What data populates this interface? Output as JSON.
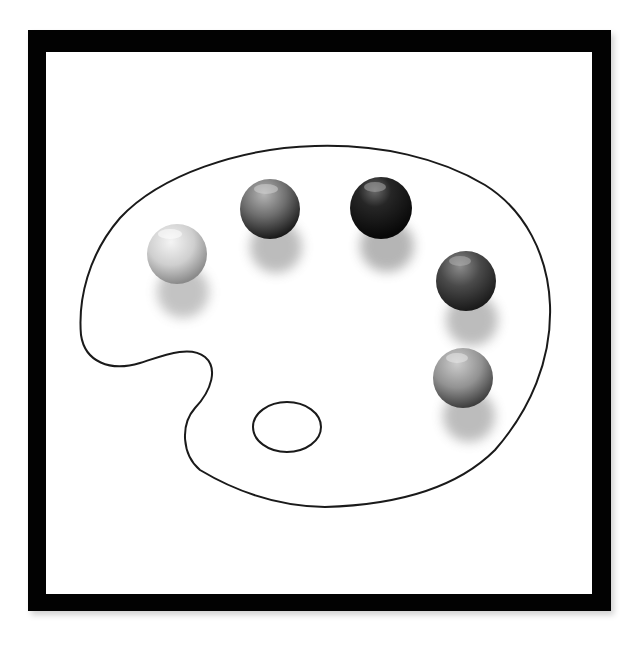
{
  "image": {
    "description": "Grayscale illustration of an artist's paint palette outline with five round candies placed as paint dabs, inside a thick black square frame",
    "colors": {
      "frame": "#020202",
      "background": "#ffffff",
      "outline": "#1a1a1a"
    }
  },
  "frame": {
    "outer": {
      "x": 28,
      "y": 30,
      "width": 583,
      "height": 581
    },
    "inner": {
      "x": 46,
      "y": 52,
      "width": 546,
      "height": 542
    }
  },
  "palette": {
    "thumb_hole": {
      "cx": 287,
      "cy": 427,
      "rx": 34,
      "ry": 25
    }
  },
  "candies": [
    {
      "name": "candy-light",
      "cx": 177,
      "cy": 254,
      "r": 30,
      "light": "#eeeeee",
      "mid": "#c8c8c8",
      "dark": "#8a8a8a"
    },
    {
      "name": "candy-medium",
      "cx": 270,
      "cy": 209,
      "r": 30,
      "light": "#b0b0b0",
      "mid": "#6e6e6e",
      "dark": "#1e1e1e"
    },
    {
      "name": "candy-dark",
      "cx": 381,
      "cy": 208,
      "r": 31,
      "light": "#7a7a7a",
      "mid": "#202020",
      "dark": "#0a0a0a"
    },
    {
      "name": "candy-dark-medium",
      "cx": 466,
      "cy": 281,
      "r": 30,
      "light": "#8c8c8c",
      "mid": "#4a4a4a",
      "dark": "#1c1c1c"
    },
    {
      "name": "candy-medium-light",
      "cx": 463,
      "cy": 378,
      "r": 30,
      "light": "#c4c4c4",
      "mid": "#8e8e8e",
      "dark": "#3e3e3e"
    }
  ]
}
